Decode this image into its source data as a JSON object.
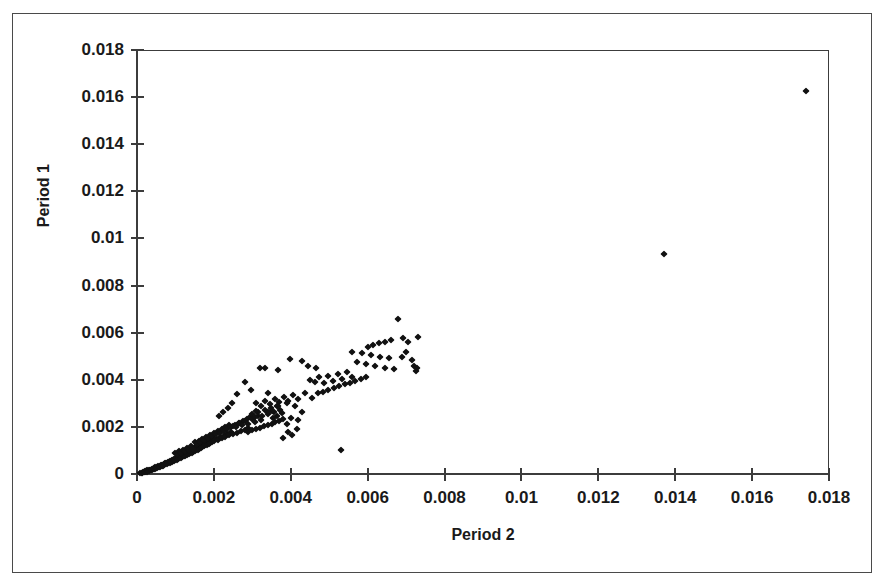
{
  "chart": {
    "title": "",
    "y_axis_title": "Period 1",
    "x_axis_title": "Period 2"
  },
  "chart_data": {
    "type": "scatter",
    "title": "",
    "xlabel": "Period 2",
    "ylabel": "Period 1",
    "xlim": [
      0,
      0.018
    ],
    "ylim": [
      0,
      0.018
    ],
    "xticks": [
      0,
      0.002,
      0.004,
      0.006,
      0.008,
      0.01,
      0.012,
      0.014,
      0.016,
      0.018
    ],
    "yticks": [
      0,
      0.002,
      0.004,
      0.006,
      0.008,
      0.01,
      0.012,
      0.014,
      0.016,
      0.018
    ],
    "xtick_labels": [
      "0",
      "0.002",
      "0.004",
      "0.006",
      "0.008",
      "0.01",
      "0.012",
      "0.014",
      "0.016",
      "0.018"
    ],
    "ytick_labels": [
      "0",
      "0.002",
      "0.004",
      "0.006",
      "0.008",
      "0.01",
      "0.012",
      "0.014",
      "0.016",
      "0.018"
    ],
    "grid": false,
    "legend": false,
    "marker": "diamond",
    "marker_color": "#111111",
    "series": [
      {
        "name": "observations",
        "points": [
          [
            8e-05,
            4e-05
          ],
          [
            0.00012,
            6e-05
          ],
          [
            0.00014,
            5e-05
          ],
          [
            0.00016,
            9e-05
          ],
          [
            0.00018,
            8e-05
          ],
          [
            0.0002,
            0.00011
          ],
          [
            0.00022,
            0.0001
          ],
          [
            0.00024,
            0.00013
          ],
          [
            0.00025,
            9e-05
          ],
          [
            0.00027,
            0.00015
          ],
          [
            0.00029,
            0.00012
          ],
          [
            0.00031,
            0.00017
          ],
          [
            0.00032,
            0.00014
          ],
          [
            0.00034,
            0.00019
          ],
          [
            0.00036,
            0.00016
          ],
          [
            0.00038,
            0.00021
          ],
          [
            0.00039,
            0.00018
          ],
          [
            0.00041,
            0.00023
          ],
          [
            0.00043,
            0.0002
          ],
          [
            0.00045,
            0.00026
          ],
          [
            0.00046,
            0.00022
          ],
          [
            0.00048,
            0.00028
          ],
          [
            0.0005,
            0.00025
          ],
          [
            0.00052,
            0.0003
          ],
          [
            0.00053,
            0.00027
          ],
          [
            0.00055,
            0.00032
          ],
          [
            0.00057,
            0.00029
          ],
          [
            0.00059,
            0.00035
          ],
          [
            0.0006,
            0.00031
          ],
          [
            0.00062,
            0.00037
          ],
          [
            0.00064,
            0.00034
          ],
          [
            0.00066,
            0.0004
          ],
          [
            0.00067,
            0.00036
          ],
          [
            0.00069,
            0.00042
          ],
          [
            0.00071,
            0.00038
          ],
          [
            0.00073,
            0.00045
          ],
          [
            0.00074,
            0.00041
          ],
          [
            0.00076,
            0.00047
          ],
          [
            0.00078,
            0.00043
          ],
          [
            0.0008,
            0.0005
          ],
          [
            0.00081,
            0.00046
          ],
          [
            0.00083,
            0.00052
          ],
          [
            0.00085,
            0.00048
          ],
          [
            0.00087,
            0.00055
          ],
          [
            0.00088,
            0.0005
          ],
          [
            0.0009,
            0.00058
          ],
          [
            0.00092,
            0.00053
          ],
          [
            0.00094,
            0.00061
          ],
          [
            0.00095,
            0.00056
          ],
          [
            0.00097,
            0.00064
          ],
          [
            0.00099,
            0.00058
          ],
          [
            0.00101,
            0.00067
          ],
          [
            0.00103,
            0.00061
          ],
          [
            0.00105,
            0.0007
          ],
          [
            0.00107,
            0.00064
          ],
          [
            0.00109,
            0.00073
          ],
          [
            0.0011,
            0.00066
          ],
          [
            0.00112,
            0.00076
          ],
          [
            0.00114,
            0.0007
          ],
          [
            0.00116,
            0.00079
          ],
          [
            0.00118,
            0.00072
          ],
          [
            0.0012,
            0.00082
          ],
          [
            0.00122,
            0.00075
          ],
          [
            0.00124,
            0.00086
          ],
          [
            0.00126,
            0.00078
          ],
          [
            0.00128,
            0.0009
          ],
          [
            0.0013,
            0.00081
          ],
          [
            0.00132,
            0.00094
          ],
          [
            0.00134,
            0.00085
          ],
          [
            0.00136,
            0.00098
          ],
          [
            0.00138,
            0.00088
          ],
          [
            0.0014,
            0.00102
          ],
          [
            0.00142,
            0.00091
          ],
          [
            0.00144,
            0.00106
          ],
          [
            0.00146,
            0.00094
          ],
          [
            0.00148,
            0.0011
          ],
          [
            0.0015,
            0.00098
          ],
          [
            0.00152,
            0.00114
          ],
          [
            0.00154,
            0.00101
          ],
          [
            0.00156,
            0.00118
          ],
          [
            0.00158,
            0.00104
          ],
          [
            0.0016,
            0.00122
          ],
          [
            0.00162,
            0.00108
          ],
          [
            0.00164,
            0.00126
          ],
          [
            0.00166,
            0.00111
          ],
          [
            0.00168,
            0.0013
          ],
          [
            0.0017,
            0.00114
          ],
          [
            0.00172,
            0.00134
          ],
          [
            0.00174,
            0.00118
          ],
          [
            0.00176,
            0.00138
          ],
          [
            0.00178,
            0.00121
          ],
          [
            0.0018,
            0.00142
          ],
          [
            0.00182,
            0.00125
          ],
          [
            0.00184,
            0.00146
          ],
          [
            0.00186,
            0.00128
          ],
          [
            0.00188,
            0.0015
          ],
          [
            0.0019,
            0.00132
          ],
          [
            0.00192,
            0.00154
          ],
          [
            0.00194,
            0.00135
          ],
          [
            0.00196,
            0.00158
          ],
          [
            0.0015,
            0.00135
          ],
          [
            0.00155,
            0.00128
          ],
          [
            0.0016,
            0.00142
          ],
          [
            0.00165,
            0.00136
          ],
          [
            0.0017,
            0.0015
          ],
          [
            0.00175,
            0.00144
          ],
          [
            0.0018,
            0.00158
          ],
          [
            0.00185,
            0.00152
          ],
          [
            0.0019,
            0.00166
          ],
          [
            0.00195,
            0.0016
          ],
          [
            0.002,
            0.00174
          ],
          [
            0.00205,
            0.00148
          ],
          [
            0.0021,
            0.00182
          ],
          [
            0.00215,
            0.00155
          ],
          [
            0.0022,
            0.0019
          ],
          [
            0.00225,
            0.00162
          ],
          [
            0.0023,
            0.00198
          ],
          [
            0.00235,
            0.0017
          ],
          [
            0.0024,
            0.00206
          ],
          [
            0.00245,
            0.00178
          ],
          [
            0.001,
            0.0009
          ],
          [
            0.00105,
            0.00084
          ],
          [
            0.0011,
            0.00096
          ],
          [
            0.00115,
            0.0009
          ],
          [
            0.0012,
            0.00104
          ],
          [
            0.00125,
            0.00096
          ],
          [
            0.0013,
            0.0011
          ],
          [
            0.00135,
            0.00102
          ],
          [
            0.0014,
            0.00118
          ],
          [
            0.00145,
            0.00108
          ],
          [
            0.002,
            0.0014
          ],
          [
            0.00205,
            0.00168
          ],
          [
            0.0021,
            0.00146
          ],
          [
            0.00215,
            0.00176
          ],
          [
            0.0022,
            0.00152
          ],
          [
            0.00225,
            0.00184
          ],
          [
            0.0023,
            0.00158
          ],
          [
            0.00235,
            0.00192
          ],
          [
            0.0024,
            0.00164
          ],
          [
            0.00245,
            0.002
          ],
          [
            0.0025,
            0.0017
          ],
          [
            0.00255,
            0.00208
          ],
          [
            0.0026,
            0.00176
          ],
          [
            0.00265,
            0.00216
          ],
          [
            0.0027,
            0.00182
          ],
          [
            0.00275,
            0.00224
          ],
          [
            0.0028,
            0.00188
          ],
          [
            0.00285,
            0.00232
          ],
          [
            0.0029,
            0.00194
          ],
          [
            0.00295,
            0.0024
          ],
          [
            0.0025,
            0.00205
          ],
          [
            0.00258,
            0.00198
          ],
          [
            0.00266,
            0.00215
          ],
          [
            0.00274,
            0.00206
          ],
          [
            0.00282,
            0.00225
          ],
          [
            0.0029,
            0.00214
          ],
          [
            0.00298,
            0.00235
          ],
          [
            0.00306,
            0.00222
          ],
          [
            0.00314,
            0.00245
          ],
          [
            0.00322,
            0.0023
          ],
          [
            0.003,
            0.00255
          ],
          [
            0.00308,
            0.0024
          ],
          [
            0.00316,
            0.00265
          ],
          [
            0.00324,
            0.00248
          ],
          [
            0.00332,
            0.00272
          ],
          [
            0.0034,
            0.00256
          ],
          [
            0.00348,
            0.0028
          ],
          [
            0.00356,
            0.00264
          ],
          [
            0.00364,
            0.00288
          ],
          [
            0.00372,
            0.00272
          ],
          [
            0.0029,
            0.0018
          ],
          [
            0.003,
            0.00186
          ],
          [
            0.0031,
            0.00192
          ],
          [
            0.0032,
            0.00196
          ],
          [
            0.0033,
            0.00202
          ],
          [
            0.0034,
            0.00208
          ],
          [
            0.0035,
            0.00214
          ],
          [
            0.0036,
            0.0022
          ],
          [
            0.0037,
            0.00226
          ],
          [
            0.0038,
            0.00232
          ],
          [
            0.0031,
            0.003
          ],
          [
            0.00322,
            0.00288
          ],
          [
            0.00334,
            0.0031
          ],
          [
            0.00346,
            0.00296
          ],
          [
            0.00358,
            0.00318
          ],
          [
            0.0037,
            0.00304
          ],
          [
            0.00382,
            0.00326
          ],
          [
            0.00394,
            0.00312
          ],
          [
            0.00406,
            0.00334
          ],
          [
            0.00418,
            0.0032
          ],
          [
            0.00296,
            0.00355
          ],
          [
            0.0031,
            0.00268
          ],
          [
            0.0034,
            0.00345
          ],
          [
            0.00352,
            0.00268
          ],
          [
            0.00364,
            0.00248
          ],
          [
            0.0039,
            0.003
          ],
          [
            0.004,
            0.00238
          ],
          [
            0.0041,
            0.0029
          ],
          [
            0.0042,
            0.0023
          ],
          [
            0.0043,
            0.00262
          ],
          [
            0.00282,
            0.0039
          ],
          [
            0.0032,
            0.00452
          ],
          [
            0.00332,
            0.00448
          ],
          [
            0.00368,
            0.00442
          ],
          [
            0.00398,
            0.00488
          ],
          [
            0.00428,
            0.0048
          ],
          [
            0.00436,
            0.00342
          ],
          [
            0.00446,
            0.0046
          ],
          [
            0.00456,
            0.00322
          ],
          [
            0.00466,
            0.00452
          ],
          [
            0.0045,
            0.004
          ],
          [
            0.00462,
            0.00392
          ],
          [
            0.00474,
            0.0041
          ],
          [
            0.00486,
            0.00386
          ],
          [
            0.00498,
            0.00418
          ],
          [
            0.0051,
            0.00396
          ],
          [
            0.00522,
            0.00426
          ],
          [
            0.00534,
            0.00404
          ],
          [
            0.00546,
            0.00434
          ],
          [
            0.00558,
            0.00412
          ],
          [
            0.0047,
            0.00342
          ],
          [
            0.00484,
            0.0035
          ],
          [
            0.00498,
            0.00358
          ],
          [
            0.00512,
            0.00366
          ],
          [
            0.00526,
            0.00372
          ],
          [
            0.0054,
            0.0038
          ],
          [
            0.00554,
            0.00388
          ],
          [
            0.00568,
            0.00396
          ],
          [
            0.00582,
            0.00404
          ],
          [
            0.00596,
            0.00412
          ],
          [
            0.0056,
            0.0052
          ],
          [
            0.00572,
            0.00476
          ],
          [
            0.00584,
            0.00512
          ],
          [
            0.00596,
            0.00468
          ],
          [
            0.00608,
            0.00504
          ],
          [
            0.0062,
            0.0046
          ],
          [
            0.00632,
            0.00498
          ],
          [
            0.00644,
            0.00452
          ],
          [
            0.00656,
            0.00492
          ],
          [
            0.00668,
            0.00446
          ],
          [
            0.006,
            0.0054
          ],
          [
            0.00615,
            0.00548
          ],
          [
            0.0063,
            0.00556
          ],
          [
            0.00645,
            0.00562
          ],
          [
            0.0066,
            0.0057
          ],
          [
            0.0068,
            0.0066
          ],
          [
            0.00692,
            0.00578
          ],
          [
            0.00704,
            0.0056
          ],
          [
            0.00716,
            0.00482
          ],
          [
            0.00726,
            0.00436
          ],
          [
            0.0072,
            0.0046
          ],
          [
            0.0073,
            0.0058
          ],
          [
            0.00728,
            0.00448
          ],
          [
            0.007,
            0.0052
          ],
          [
            0.0069,
            0.00498
          ],
          [
            0.0053,
            0.001
          ],
          [
            0.0038,
            0.00152
          ],
          [
            0.00392,
            0.00178
          ],
          [
            0.00404,
            0.00166
          ],
          [
            0.00416,
            0.0019
          ],
          [
            0.0026,
            0.0034
          ],
          [
            0.00248,
            0.003
          ],
          [
            0.00236,
            0.0028
          ],
          [
            0.00224,
            0.00262
          ],
          [
            0.00212,
            0.00248
          ],
          [
            0.00342,
            0.00262
          ],
          [
            0.00354,
            0.00236
          ],
          [
            0.00366,
            0.00288
          ],
          [
            0.00378,
            0.00258
          ],
          [
            0.0039,
            0.00214
          ],
          [
            0.0137,
            0.00935
          ],
          [
            0.0174,
            0.01625
          ]
        ]
      }
    ],
    "outliers": [
      {
        "x": 0.0137,
        "y": 0.00935
      },
      {
        "x": 0.0174,
        "y": 0.01625
      }
    ],
    "n_points": 262,
    "note": "Strongly positive, near-linear relationship between Period 1 and Period 2 with dense mass near origin and two high-value outliers."
  }
}
